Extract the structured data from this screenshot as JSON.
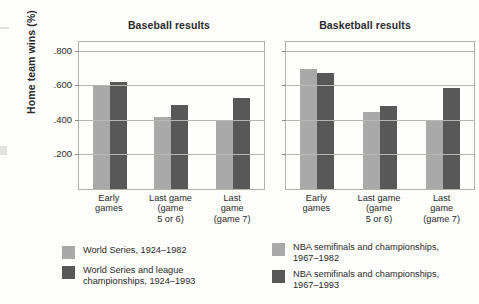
{
  "figure": {
    "ylabel": "Home team wins (%)"
  },
  "chart_data": [
    {
      "type": "bar",
      "title": "Baseball results",
      "xlabel": "",
      "ylabel": "Home team wins (%)",
      "categories": [
        "Early\ngames",
        "Last game\n(game\n5 or 6)",
        "Last\ngame\n(game 7)"
      ],
      "ylim": [
        0,
        0.85
      ],
      "yticks": [
        0.2,
        0.4,
        0.6,
        0.8
      ],
      "ytick_labels": [
        ".200",
        ".400",
        ".600",
        ".800"
      ],
      "grid": true,
      "legend_position": "below",
      "series": [
        {
          "name": "World Series, 1924–1982",
          "color": "#a9a9a9",
          "values": [
            0.6,
            0.418,
            0.394
          ]
        },
        {
          "name": "World Series and league\nchampionships, 1924–1993",
          "color": "#585858",
          "values": [
            0.617,
            0.485,
            0.524
          ]
        }
      ]
    },
    {
      "type": "bar",
      "title": "Basketball results",
      "xlabel": "",
      "ylabel": "Home team wins (%)",
      "categories": [
        "Early\ngames",
        "Last game\n(game\n5 or 6)",
        "Last\ngame\n(game 7)"
      ],
      "ylim": [
        0,
        0.85
      ],
      "yticks": [
        0.2,
        0.4,
        0.6,
        0.8
      ],
      "ytick_labels": [
        ".200",
        ".400",
        ".600",
        ".800"
      ],
      "grid": true,
      "legend_position": "below",
      "series": [
        {
          "name": "NBA semifinals and championships,\n1967–1982",
          "color": "#a9a9a9",
          "values": [
            0.694,
            0.446,
            0.394
          ]
        },
        {
          "name": "NBA semifinals and championships,\n1967–1993",
          "color": "#585858",
          "values": [
            0.673,
            0.479,
            0.584
          ]
        }
      ]
    }
  ]
}
